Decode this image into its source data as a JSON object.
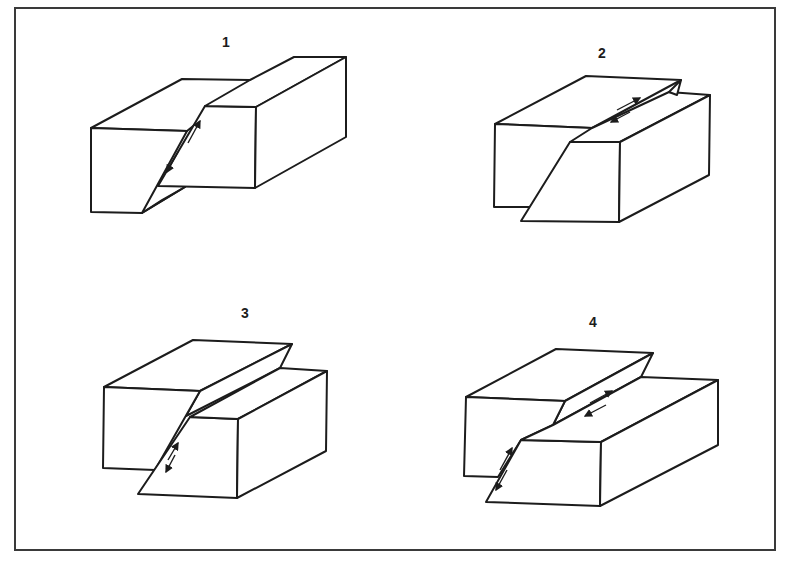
{
  "figure": {
    "frame": {
      "border_color": "#3a3a3a",
      "background": "#ffffff"
    },
    "panels": [
      {
        "id": 1,
        "label": "1",
        "label_pos": [
          226,
          42
        ],
        "fault_type": "dip-slip fault (hanging wall up on dipping plane)",
        "slip_arrows": "on front face along dip"
      },
      {
        "id": 2,
        "label": "2",
        "label_pos": [
          602,
          53
        ],
        "fault_type": "strike-slip fault",
        "slip_arrows": "on top face along strike"
      },
      {
        "id": 3,
        "label": "3",
        "label_pos": [
          245,
          313
        ],
        "fault_type": "dip-slip fault (reverse sense)",
        "slip_arrows": "on front face along dip"
      },
      {
        "id": 4,
        "label": "4",
        "label_pos": [
          593,
          322
        ],
        "fault_type": "oblique-slip fault",
        "slip_arrows": "on top face along strike and on front face along dip"
      }
    ]
  }
}
